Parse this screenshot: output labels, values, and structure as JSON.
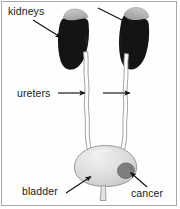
{
  "figure": {
    "background_color": "#ffffff",
    "border_color": "#a8a8a8",
    "labels": [
      {
        "id": "kidneys",
        "text": "kidneys",
        "x": 8,
        "y": 6,
        "points_to": "kidney-left"
      },
      {
        "id": "ureters",
        "text": "ureters",
        "x": 17,
        "y": 88,
        "points_to": "ureter-left"
      },
      {
        "id": "bladder",
        "text": "bladder",
        "x": 22,
        "y": 186,
        "points_to": "bladder-body"
      },
      {
        "id": "cancer",
        "text": "cancer",
        "x": 131,
        "y": 188,
        "points_to": "tumor"
      }
    ],
    "arrows": [
      {
        "id": "arrow-kidney-left",
        "from_x": 33,
        "from_y": 20,
        "to_x": 62,
        "to_y": 38
      },
      {
        "id": "arrow-kidney-right",
        "from_x": 98,
        "from_y": 8,
        "to_x": 128,
        "to_y": 23
      },
      {
        "id": "arrow-ureter-left",
        "from_x": 58,
        "from_y": 93,
        "to_x": 86,
        "to_y": 93
      },
      {
        "id": "arrow-ureter-right",
        "from_x": 103,
        "from_y": 93,
        "to_x": 131,
        "to_y": 93
      },
      {
        "id": "arrow-bladder",
        "from_x": 66,
        "from_y": 193,
        "to_x": 92,
        "to_y": 176
      },
      {
        "id": "arrow-cancer",
        "from_x": 147,
        "from_y": 187,
        "to_x": 130,
        "to_y": 172
      }
    ],
    "organs": {
      "kidney_color": "#141414",
      "adrenal_color": "#b9b9b9",
      "ureter_outline_color": "#9a9a9a",
      "ureter_fill_color": "#fdfdfd",
      "bladder_fill_color": "#d9d9d9",
      "bladder_highlight_color": "#efefef",
      "bladder_outline_color": "#8f8f8f",
      "tumor_color": "#7e7e7e",
      "tumor_outline_color": "#5c5c5c",
      "arrow_color": "#111111"
    }
  }
}
